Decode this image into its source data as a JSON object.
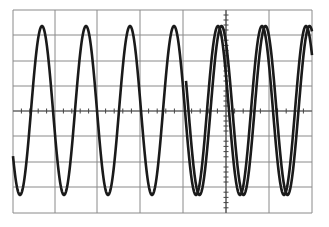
{
  "chart_data": {
    "type": "line",
    "title": "",
    "xlabel": "",
    "ylabel": "",
    "grid": {
      "on": true,
      "columns": 7,
      "rows": 8,
      "x_lines_px": [
        13,
        55,
        97,
        140,
        183,
        226,
        269,
        312
      ],
      "y_lines_px": [
        10,
        35,
        61,
        86,
        111,
        136,
        162,
        187,
        213
      ],
      "center_x_px": 226,
      "center_y_px": 111,
      "minor_ticks_per_division": 5,
      "color": "#8a8a8a"
    },
    "xlim": [
      0,
      7
    ],
    "ylim": [
      -4,
      4
    ],
    "series": [
      {
        "name": "trace-primary",
        "waveform": "sine",
        "period_divisions": 1.03,
        "amplitude_divisions": 3.3,
        "offset_divisions": 0,
        "peak_x_px": [
          42,
          86,
          130,
          174,
          218,
          262,
          306
        ],
        "trough_x_px": [
          19,
          63,
          108,
          152,
          196,
          240,
          284
        ],
        "peak_y_px": 26,
        "trough_y_px": 195,
        "color": "#1a1a1a"
      },
      {
        "name": "trace-ghost",
        "waveform": "sine",
        "starts_at_x_px": 186,
        "phase_offset_px": 3.5,
        "color": "#1a1a1a"
      }
    ]
  },
  "style": {
    "background": "#ffffff",
    "trace_color": "#1a1a1a",
    "grid_color": "#8a8a8a",
    "trace_width": 2.6
  }
}
